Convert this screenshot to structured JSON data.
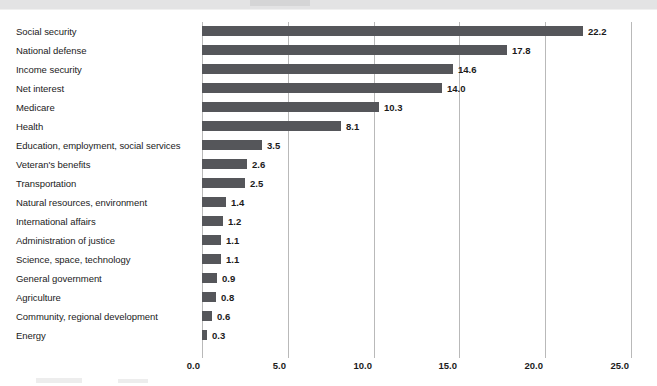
{
  "chart_data": {
    "type": "bar",
    "orientation": "horizontal",
    "title": "",
    "subtitle": "",
    "xlabel": "",
    "ylabel": "",
    "xlim": [
      0.0,
      25.0
    ],
    "xticks": [
      "0.0",
      "5.0",
      "10.0",
      "15.0",
      "20.0",
      "25.0"
    ],
    "xtick_values": [
      0.0,
      5.0,
      10.0,
      15.0,
      20.0,
      25.0
    ],
    "grid": "vertical",
    "legend": "none",
    "bar_color": "#55565a",
    "gridline_color": "#b9b9b9",
    "categories": [
      "Social security",
      "National defense",
      "Income security",
      "Net interest",
      "Medicare",
      "Health",
      "Education, employment, social services",
      "Veteran's benefits",
      "Transportation",
      "Natural resources, environment",
      "International affairs",
      "Administration of justice",
      "Science, space, technology",
      "General government",
      "Agriculture",
      "Community, regional development",
      "Energy"
    ],
    "values": [
      22.2,
      17.8,
      14.6,
      14.0,
      10.3,
      8.1,
      3.5,
      2.6,
      2.5,
      1.4,
      1.2,
      1.1,
      1.1,
      0.9,
      0.8,
      0.6,
      0.3
    ],
    "value_labels": [
      "22.2",
      "17.8",
      "14.6",
      "14.0",
      "10.3",
      "8.1",
      "3.5",
      "2.6",
      "2.5",
      "1.4",
      "1.2",
      "1.1",
      "1.1",
      "0.9",
      "0.8",
      "0.6",
      "0.3"
    ]
  }
}
